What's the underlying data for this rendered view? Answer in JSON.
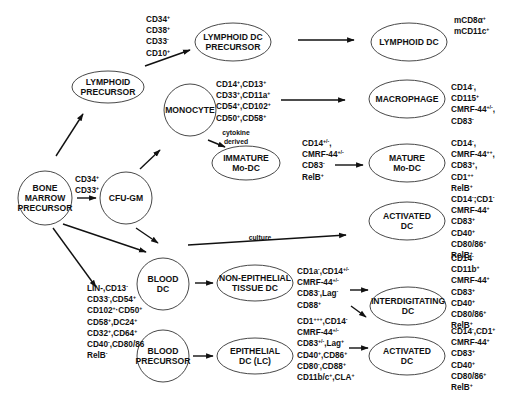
{
  "nodes": [
    {
      "id": "bone-marrow-precursor",
      "lines": [
        "BONE",
        "MARROW",
        "PRECURSOR"
      ],
      "cx": 45,
      "cy": 198,
      "rx": 27,
      "ry": 27
    },
    {
      "id": "lymphoid-precursor",
      "lines": [
        "LYMPHOID",
        "PRECURSOR"
      ],
      "cx": 108,
      "cy": 87,
      "rx": 36,
      "ry": 16
    },
    {
      "id": "cfu-gm",
      "lines": [
        "CFU-GM"
      ],
      "cx": 126,
      "cy": 198,
      "rx": 26,
      "ry": 26
    },
    {
      "id": "lymphoid-dc-precursor",
      "lines": [
        "LYMPHOID DC",
        "PRECURSOR"
      ],
      "cx": 233,
      "cy": 42,
      "rx": 38,
      "ry": 19
    },
    {
      "id": "monocyte",
      "lines": [
        "MONOCYTE"
      ],
      "cx": 190,
      "cy": 110,
      "rx": 26,
      "ry": 26
    },
    {
      "id": "immature-mo-dc",
      "lines": [
        "IMMATURE",
        "Mo-DC"
      ],
      "cx": 246,
      "cy": 163,
      "rx": 34,
      "ry": 17
    },
    {
      "id": "blood-dc",
      "lines": [
        "BLOOD",
        "DC"
      ],
      "cx": 163,
      "cy": 284,
      "rx": 26,
      "ry": 26
    },
    {
      "id": "blood-precursor",
      "lines": [
        "BLOOD",
        "PRECURSOR"
      ],
      "cx": 163,
      "cy": 356,
      "rx": 26,
      "ry": 26
    },
    {
      "id": "non-epithelial-tissue-dc",
      "lines": [
        "NON-EPITHELIAL",
        "TISSUE DC"
      ],
      "cx": 255,
      "cy": 283,
      "rx": 38,
      "ry": 18
    },
    {
      "id": "epithelial-dc-lc",
      "lines": [
        "EPITHELIAL",
        "DC (LC)"
      ],
      "cx": 255,
      "cy": 356,
      "rx": 38,
      "ry": 18
    },
    {
      "id": "lymphoid-dc",
      "lines": [
        "LYMPHOID DC"
      ],
      "cx": 409,
      "cy": 42,
      "rx": 38,
      "ry": 19
    },
    {
      "id": "macrophage",
      "lines": [
        "MACROPHAGE"
      ],
      "cx": 407,
      "cy": 99,
      "rx": 38,
      "ry": 19
    },
    {
      "id": "mature-mo-dc",
      "lines": [
        "MATURE",
        "Mo-DC"
      ],
      "cx": 407,
      "cy": 163,
      "rx": 38,
      "ry": 19
    },
    {
      "id": "activated-dc-top",
      "lines": [
        "ACTIVATED",
        "DC"
      ],
      "cx": 407,
      "cy": 221,
      "rx": 38,
      "ry": 19
    },
    {
      "id": "interdigitating-dc",
      "lines": [
        "INTERDIGITATING",
        "DC"
      ],
      "cx": 408,
      "cy": 306,
      "rx": 38,
      "ry": 19
    },
    {
      "id": "activated-dc-bottom",
      "lines": [
        "ACTIVATED",
        "DC"
      ],
      "cx": 407,
      "cy": 356,
      "rx": 38,
      "ry": 19
    }
  ],
  "marker_groups": [
    {
      "id": "markers-lymphoid-precursor",
      "x": 146,
      "y": 22,
      "lines": [
        [
          "CD34",
          "+"
        ],
        [
          "CD38",
          "+"
        ],
        [
          "CD33",
          "-"
        ],
        [
          "CD10",
          "+"
        ]
      ]
    },
    {
      "id": "markers-cfu-gm",
      "x": 75,
      "y": 182,
      "lines": [
        [
          "CD34",
          "+"
        ],
        [
          "CD33",
          "+"
        ]
      ]
    },
    {
      "id": "markers-monocyte",
      "x": 216,
      "y": 87,
      "lines": [
        [
          "CD14",
          "+",
          ",CD13",
          "+"
        ],
        [
          "CD33",
          "+",
          ",CD11a",
          "+"
        ],
        [
          "CD54",
          "+",
          ",CD102",
          "+"
        ],
        [
          "CD50",
          "+",
          ",CD58",
          "+"
        ]
      ]
    },
    {
      "id": "markers-immature-mo-dc",
      "x": 302,
      "y": 146,
      "lines": [
        [
          "CD14",
          "+/-",
          ","
        ],
        [
          "CMRF-44",
          "+/-"
        ],
        [
          "CD83",
          "-"
        ],
        [
          "RelB",
          "+"
        ]
      ]
    },
    {
      "id": "markers-lymphoid-dc",
      "x": 454,
      "y": 23,
      "lines": [
        [
          "mCD8α",
          "+"
        ],
        [
          "mCD11c",
          "+"
        ]
      ]
    },
    {
      "id": "markers-macrophage",
      "x": 451,
      "y": 90,
      "lines": [
        [
          "CD14",
          "-",
          ","
        ],
        [
          "CD115",
          "+"
        ],
        [
          "CMRF-44",
          "+/-",
          ","
        ],
        [
          "CD83",
          "-"
        ]
      ]
    },
    {
      "id": "markers-mature-mo-dc",
      "x": 451,
      "y": 146,
      "lines": [
        [
          "CD14",
          "-",
          ","
        ],
        [
          "CMRF-44",
          "++",
          ","
        ],
        [
          "CD83",
          "+",
          ","
        ],
        [
          "CD1",
          "++"
        ],
        [
          "RelB",
          "+"
        ]
      ]
    },
    {
      "id": "markers-activated-dc-top",
      "x": 451,
      "y": 202,
      "lines": [
        [
          "CD14",
          "-",
          ";CD1",
          "-"
        ],
        [
          "CMRF-44",
          "+"
        ],
        [
          "CD83",
          "+"
        ],
        [
          "CD40",
          "+"
        ],
        [
          "CD80/86",
          "+"
        ],
        [
          "RelB",
          "+"
        ]
      ]
    },
    {
      "id": "markers-blood-dc",
      "x": 87,
      "y": 291,
      "lines": [
        [
          "LIN-,CD13",
          "-"
        ],
        [
          "CD33",
          "-",
          ",CD54",
          "+"
        ],
        [
          "CD102",
          "+",
          "·CD50",
          "+"
        ],
        [
          "CD58",
          "+",
          ",DC24",
          "+"
        ],
        [
          "CD32",
          "+",
          ",CD64",
          "+"
        ],
        [
          "CD40",
          "-",
          ",CD80/86"
        ],
        [
          "RelB",
          "-"
        ]
      ]
    },
    {
      "id": "markers-non-epithelial",
      "x": 297,
      "y": 274,
      "lines": [
        [
          "CD1a",
          "-",
          ",CD14",
          "+/-"
        ],
        [
          "CMRF-44",
          "+/-"
        ],
        [
          "CD83",
          "-",
          ",Lag",
          "-"
        ],
        [
          "CD88",
          "+"
        ]
      ]
    },
    {
      "id": "markers-epithelial",
      "x": 297,
      "y": 324,
      "lines": [
        [
          "CD1",
          "+++",
          ",CD14",
          "-"
        ],
        [
          "CMRF-44",
          "+/-"
        ],
        [
          "CD83",
          "+/-",
          ",Lag",
          "+"
        ],
        [
          "CD40",
          "+",
          ",CD86",
          "+"
        ],
        [
          "CD80",
          "-",
          ",CD88",
          "+"
        ],
        [
          "CD11b/c",
          "+",
          ",CLA",
          "+"
        ]
      ]
    },
    {
      "id": "markers-interdigitating-dc",
      "x": 451,
      "y": 261,
      "lines": [
        [
          "CD14",
          "-"
        ],
        [
          "CD11b",
          "+"
        ],
        [
          "CMRF-44",
          "+"
        ],
        [
          "CD83",
          "+"
        ],
        [
          "CD40",
          "+"
        ],
        [
          "CD80/86",
          "+"
        ],
        [
          "RelB",
          "+"
        ]
      ]
    },
    {
      "id": "markers-activated-dc-bottom",
      "x": 451,
      "y": 334,
      "lines": [
        [
          "CD14",
          "-",
          ",CD1",
          "+"
        ],
        [
          "CMRF-44",
          "+"
        ],
        [
          "CD83",
          "+"
        ],
        [
          "CD40",
          "+"
        ],
        [
          "CD80/86",
          "+"
        ],
        [
          "RelB",
          "+"
        ]
      ]
    }
  ],
  "edge_labels": [
    {
      "id": "label-cytokine-derived",
      "x": 236,
      "y": 135,
      "lines": [
        "cytokine",
        "derived"
      ]
    },
    {
      "id": "label-culture",
      "x": 260,
      "y": 240,
      "lines": [
        "culture"
      ]
    }
  ],
  "edges": [
    {
      "from": "bone-marrow-precursor",
      "to": "lymphoid-precursor",
      "x1": 56,
      "y1": 156,
      "x2": 83,
      "y2": 114
    },
    {
      "from": "bone-marrow-precursor",
      "to": "cfu-gm",
      "x1": 77,
      "y1": 198,
      "x2": 96,
      "y2": 198
    },
    {
      "from": "bone-marrow-precursor",
      "to": "blood-dc",
      "x1": 63,
      "y1": 224,
      "x2": 146,
      "y2": 252
    },
    {
      "from": "bone-marrow-precursor",
      "to": "blood-dc-markers",
      "x1": 53,
      "y1": 228,
      "x2": 96,
      "y2": 287
    },
    {
      "from": "lymphoid-precursor",
      "to": "lymphoid-dc-precursor",
      "x1": 145,
      "y1": 66,
      "x2": 190,
      "y2": 50
    },
    {
      "from": "cfu-gm",
      "to": "monocyte",
      "x1": 140,
      "y1": 169,
      "x2": 160,
      "y2": 150
    },
    {
      "from": "cfu-gm",
      "to": "blood-dc",
      "x1": 136,
      "y1": 228,
      "x2": 158,
      "y2": 243
    },
    {
      "from": "monocyte",
      "to": "immature-mo-dc",
      "x1": 208,
      "y1": 140,
      "x2": 225,
      "y2": 147
    },
    {
      "from": "lymphoid-dc-precursor",
      "to": "lymphoid-dc",
      "x1": 298,
      "y1": 40,
      "x2": 354,
      "y2": 40
    },
    {
      "from": "monocyte-markers",
      "to": "macrophage",
      "x1": 281,
      "y1": 100,
      "x2": 345,
      "y2": 100
    },
    {
      "from": "immature-mo-dc-markers",
      "to": "mature-mo-dc",
      "x1": 335,
      "y1": 165,
      "x2": 363,
      "y2": 165
    },
    {
      "from": "blood-dc",
      "to": "activated-dc-top",
      "x1": 188,
      "y1": 245,
      "x2": 346,
      "y2": 235
    },
    {
      "from": "blood-dc",
      "to": "non-epithelial-tissue-dc",
      "x1": 195,
      "y1": 283,
      "x2": 213,
      "y2": 283
    },
    {
      "from": "blood-precursor",
      "to": "epithelial-dc-lc",
      "x1": 193,
      "y1": 356,
      "x2": 213,
      "y2": 356
    },
    {
      "from": "non-epithelial-markers",
      "to": "interdigitating-dc",
      "x1": 350,
      "y1": 290,
      "x2": 368,
      "y2": 290
    },
    {
      "from": "non-epithelial-markers",
      "to": "activated-dc-bottom",
      "x1": 351,
      "y1": 306,
      "x2": 366,
      "y2": 317
    },
    {
      "from": "epithelial-markers",
      "to": "activated-dc-bottom",
      "x1": 349,
      "y1": 348,
      "x2": 368,
      "y2": 348
    }
  ]
}
